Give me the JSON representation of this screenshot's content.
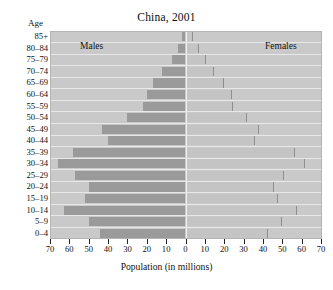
{
  "chart_data": {
    "type": "bar",
    "subtype": "population-pyramid",
    "title": "China, 2001",
    "xlabel": "Population (in millions)",
    "ylabel": "Age",
    "xlim": [
      -70,
      70
    ],
    "xticks": [
      70,
      60,
      50,
      40,
      30,
      20,
      10,
      0,
      10,
      20,
      30,
      40,
      50,
      60,
      70
    ],
    "xtick_labels": [
      "70",
      "60",
      "50",
      "40",
      "30",
      "20",
      "10",
      "0",
      "10",
      "20",
      "30",
      "40",
      "50",
      "60",
      "70"
    ],
    "grid": false,
    "legend_position": "inside-top",
    "categories": [
      "85+",
      "80–84",
      "75–79",
      "70–74",
      "65–69",
      "60–64",
      "55–59",
      "50–54",
      "45–49",
      "40–44",
      "35–39",
      "30–34",
      "25–29",
      "20–24",
      "15–19",
      "10–14",
      "5–9",
      "0–4"
    ],
    "series": [
      {
        "name": "Males",
        "side": "left",
        "color": "#9a9a9a",
        "values": [
          2,
          4,
          7,
          12,
          17,
          20,
          22,
          30,
          43,
          40,
          58,
          66,
          57,
          50,
          52,
          63,
          50,
          44
        ]
      },
      {
        "name": "Females",
        "side": "right",
        "color": "#c4c4c4",
        "values": [
          3,
          6,
          10,
          14,
          19,
          23,
          24,
          31,
          37,
          35,
          56,
          61,
          50,
          45,
          47,
          57,
          49,
          42
        ]
      }
    ],
    "annotations": [
      {
        "text": "Males",
        "position": "upper-left"
      },
      {
        "text": "Females",
        "position": "upper-right"
      }
    ]
  },
  "axis": {
    "age_caption": "Age"
  },
  "colors": {
    "plot_background": "#c9c9c9",
    "male_bar": "#9a9a9a",
    "female_bar": "#c4c4c4",
    "row_separator": "#e8e8e8",
    "zero_line": "#f2f2f2",
    "text": "#111111"
  }
}
